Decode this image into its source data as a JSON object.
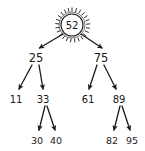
{
  "figure": {
    "kind": "binary-search-tree-diagram",
    "background_color": "#ffffff",
    "stroke_color": "#1a1a1a",
    "root_highlight": "sunburst-circle"
  },
  "tree": {
    "root": {
      "id": "node-52",
      "label": "52",
      "highlighted": true,
      "cx": 72,
      "cy": 25,
      "r": 11
    },
    "level2": [
      {
        "id": "node-25",
        "label": "25",
        "cx": 36,
        "cy": 58
      },
      {
        "id": "node-75",
        "label": "75",
        "cx": 101,
        "cy": 58
      }
    ],
    "level3": [
      {
        "id": "node-11",
        "label": "11",
        "cx": 16,
        "cy": 99
      },
      {
        "id": "node-33",
        "label": "33",
        "cx": 43,
        "cy": 99
      },
      {
        "id": "node-61",
        "label": "61",
        "cx": 88,
        "cy": 99
      },
      {
        "id": "node-89",
        "label": "89",
        "cx": 119,
        "cy": 99
      }
    ],
    "level4": [
      {
        "id": "node-30",
        "label": "30",
        "cx": 37,
        "cy": 140
      },
      {
        "id": "node-40",
        "label": "40",
        "cx": 56,
        "cy": 140
      },
      {
        "id": "node-82",
        "label": "82",
        "cx": 112,
        "cy": 140
      },
      {
        "id": "node-95",
        "label": "95",
        "cx": 132,
        "cy": 140
      }
    ],
    "edges": [
      {
        "id": "edge-52-25",
        "from": "52",
        "to": "25",
        "x1": 63,
        "y1": 34,
        "x2": 38,
        "y2": 49
      },
      {
        "id": "edge-52-75",
        "from": "52",
        "to": "75",
        "x1": 81,
        "y1": 34,
        "x2": 103,
        "y2": 49
      },
      {
        "id": "edge-25-11",
        "from": "25",
        "to": "11",
        "x1": 32,
        "y1": 66,
        "x2": 18,
        "y2": 90
      },
      {
        "id": "edge-25-33",
        "from": "25",
        "to": "33",
        "x1": 39,
        "y1": 66,
        "x2": 43,
        "y2": 90
      },
      {
        "id": "edge-75-61",
        "from": "75",
        "to": "61",
        "x1": 97,
        "y1": 66,
        "x2": 89,
        "y2": 90
      },
      {
        "id": "edge-75-89",
        "from": "75",
        "to": "89",
        "x1": 104,
        "y1": 66,
        "x2": 117,
        "y2": 90
      },
      {
        "id": "edge-33-30",
        "from": "33",
        "to": "30",
        "x1": 45,
        "y1": 106,
        "x2": 38,
        "y2": 131
      },
      {
        "id": "edge-33-40",
        "from": "33",
        "to": "40",
        "x1": 47,
        "y1": 106,
        "x2": 55,
        "y2": 131
      },
      {
        "id": "edge-89-82",
        "from": "89",
        "to": "82",
        "x1": 119,
        "y1": 106,
        "x2": 113,
        "y2": 131
      },
      {
        "id": "edge-89-95",
        "from": "89",
        "to": "95",
        "x1": 122,
        "y1": 106,
        "x2": 130,
        "y2": 131
      }
    ]
  }
}
